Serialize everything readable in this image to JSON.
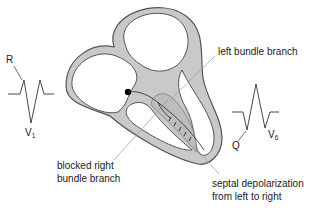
{
  "diagram": {
    "colors": {
      "wall_fill": "#c9c9c9",
      "wall_stroke": "#555555",
      "chamber_fill": "#ffffff",
      "text": "#222222",
      "leader_line": "#9a9a9a",
      "node": "#000000"
    },
    "labels": {
      "left_bundle_branch": "left bundle branch",
      "blocked_right_line1": "blocked right",
      "blocked_right_line2": "bundle branch",
      "septal_line1": "septal depolarization",
      "septal_line2": "from left to right"
    },
    "ecg_v1": {
      "lead_name": "V",
      "lead_subscript": "1",
      "wave_label": "R"
    },
    "ecg_v6": {
      "lead_name": "V",
      "lead_subscript": "6",
      "wave_label": "Q"
    },
    "septal_arrows_count": 5
  }
}
